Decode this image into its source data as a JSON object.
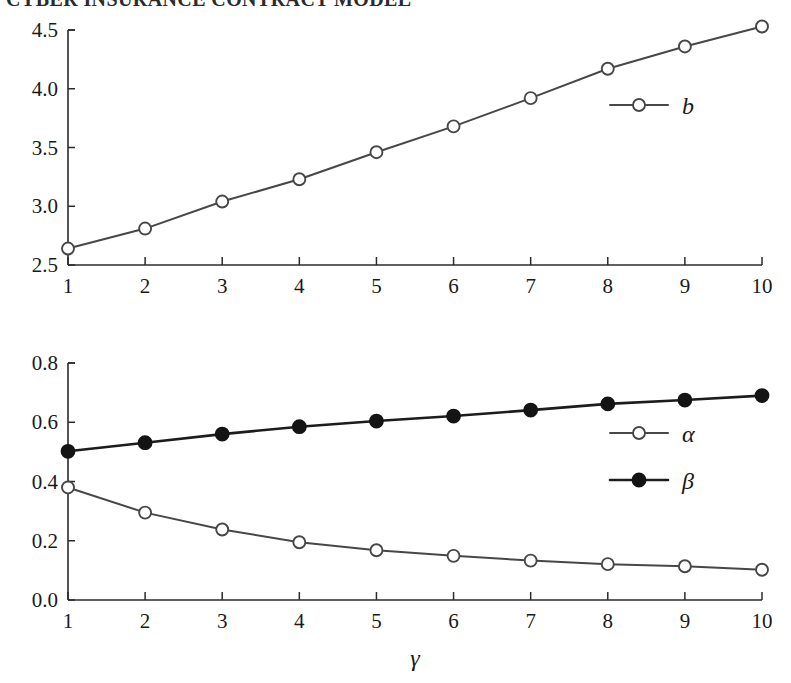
{
  "header": {
    "running_title": "CYBER INSURANCE CONTRACT MODEL"
  },
  "chart_data": [
    {
      "id": "top",
      "type": "line",
      "title": "",
      "xlabel": "γ",
      "ylabel": "",
      "x": [
        1,
        2,
        3,
        4,
        5,
        6,
        7,
        8,
        9,
        10
      ],
      "xticklabels": [
        "1",
        "2",
        "3",
        "4",
        "5",
        "6",
        "7",
        "8",
        "9",
        "10"
      ],
      "yticklabels": [
        "2.5",
        "3.0",
        "3.5",
        "4.0",
        "4.5"
      ],
      "ytickvalues": [
        2.5,
        3.0,
        3.5,
        4.0,
        4.5
      ],
      "xlim": [
        1,
        10
      ],
      "ylim": [
        2.5,
        4.5
      ],
      "grid": false,
      "legend_position": "right-upper",
      "series": [
        {
          "name": "b",
          "marker": "open-circle",
          "color": "#474747",
          "values": [
            2.64,
            2.81,
            3.04,
            3.23,
            3.46,
            3.68,
            3.92,
            4.17,
            4.36,
            4.53
          ]
        }
      ]
    },
    {
      "id": "bottom",
      "type": "line",
      "title": "",
      "xlabel": "γ",
      "ylabel": "",
      "x": [
        1,
        2,
        3,
        4,
        5,
        6,
        7,
        8,
        9,
        10
      ],
      "xticklabels": [
        "1",
        "2",
        "3",
        "4",
        "5",
        "6",
        "7",
        "8",
        "9",
        "10"
      ],
      "yticklabels": [
        "0.0",
        "0.2",
        "0.4",
        "0.6",
        "0.8"
      ],
      "ytickvalues": [
        0.0,
        0.2,
        0.4,
        0.6,
        0.8
      ],
      "xlim": [
        1,
        10
      ],
      "ylim": [
        0.0,
        0.8
      ],
      "grid": false,
      "legend_position": "right-middle",
      "series": [
        {
          "name": "α",
          "marker": "open-circle",
          "color": "#474747",
          "values": [
            0.38,
            0.295,
            0.238,
            0.195,
            0.168,
            0.149,
            0.133,
            0.121,
            0.114,
            0.102
          ]
        },
        {
          "name": "β",
          "marker": "filled-circle",
          "color": "#141414",
          "values": [
            0.502,
            0.531,
            0.56,
            0.585,
            0.604,
            0.621,
            0.641,
            0.662,
            0.675,
            0.69
          ]
        }
      ]
    }
  ]
}
